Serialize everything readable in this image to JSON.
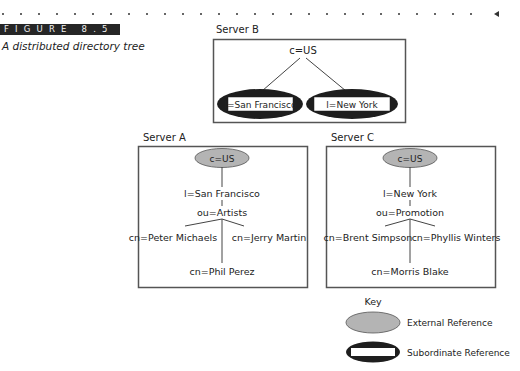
{
  "figure": {
    "label": "FIGURE 8.5",
    "caption": "A distributed directory tree"
  },
  "colors": {
    "external_reference_fill": "#b4b4b4",
    "subordinate_reference_fill": "#1e1e1e",
    "box_border": "#555555",
    "line": "#444444",
    "figure_bar": "#262626"
  },
  "servers": {
    "b": {
      "title": "Server B",
      "root": "c=US",
      "children": [
        "l=San Francisco",
        "l=New York"
      ]
    },
    "a": {
      "title": "Server A",
      "root": "c=US",
      "locality": "l=San Francisco",
      "org_unit": "ou=Artists",
      "people": [
        "cn=Peter Michaels",
        "cn=Jerry Martin",
        "cn=Phil Perez"
      ]
    },
    "c": {
      "title": "Server C",
      "root": "c=US",
      "locality": "l=New York",
      "org_unit": "ou=Promotion",
      "people": [
        "cn=Brent Simpson",
        "cn=Phyllis Winters",
        "cn=Morris Blake"
      ]
    }
  },
  "key": {
    "title": "Key",
    "items": [
      {
        "label": "External Reference",
        "shape": "gray-ellipse"
      },
      {
        "label": "Subordinate Reference",
        "shape": "black-ellipse-with-white-bar"
      }
    ]
  }
}
